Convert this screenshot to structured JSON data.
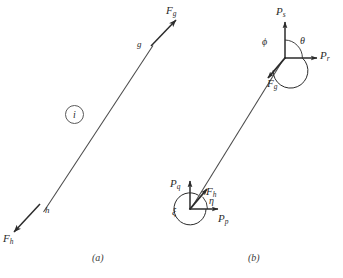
{
  "figure": {
    "background_color": "#ffffff",
    "ink_color": "#2b2b2b",
    "panels": [
      {
        "id": "a",
        "caption": "(a)",
        "member_label": "i",
        "end_labels": [
          {
            "name": "g",
            "text": "g"
          },
          {
            "name": "h",
            "text": "h"
          }
        ],
        "force_vectors": [
          {
            "name": "F-g",
            "base": "F",
            "sub": "g",
            "direction": "up-right"
          },
          {
            "name": "F-h",
            "base": "F",
            "sub": "h",
            "direction": "down-left"
          }
        ]
      },
      {
        "id": "b",
        "caption": "(b)",
        "near_end": {
          "force": {
            "base": "F",
            "sub": "g"
          },
          "components": [
            {
              "base": "P",
              "sub": "s",
              "direction": "up"
            },
            {
              "base": "P",
              "sub": "r",
              "direction": "right"
            }
          ],
          "angles": [
            {
              "name": "theta",
              "glyph": "θ"
            },
            {
              "name": "phi",
              "glyph": "ϕ"
            }
          ]
        },
        "far_end": {
          "force": {
            "base": "F",
            "sub": "h"
          },
          "components": [
            {
              "base": "P",
              "sub": "q",
              "direction": "up"
            },
            {
              "base": "P",
              "sub": "p",
              "direction": "right"
            }
          ],
          "angles": [
            {
              "name": "eta",
              "glyph": "η"
            },
            {
              "name": "xi",
              "glyph": "ξ"
            }
          ]
        }
      }
    ]
  },
  "labels": {
    "panel_a": {
      "force_g_base": "F",
      "force_g_sub": "g",
      "force_h_base": "F",
      "force_h_sub": "h",
      "end_g": "g",
      "end_h": "h",
      "member_i": "i",
      "caption": "(a)"
    },
    "panel_b": {
      "p_s_base": "P",
      "p_s_sub": "s",
      "p_r_base": "P",
      "p_r_sub": "r",
      "f_g_base": "F",
      "f_g_sub": "g",
      "theta": "θ",
      "phi": "ϕ",
      "p_q_base": "P",
      "p_q_sub": "q",
      "p_p_base": "P",
      "p_p_sub": "p",
      "f_h_base": "F",
      "f_h_sub": "h",
      "eta": "η",
      "xi": "ξ",
      "caption": "(b)"
    }
  }
}
